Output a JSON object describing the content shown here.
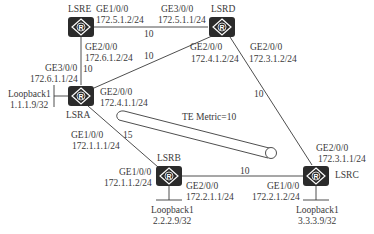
{
  "routers": [
    {
      "id": "LSRE",
      "label": "LSRE"
    },
    {
      "id": "LSRD",
      "label": "LSRD"
    },
    {
      "id": "LSRA",
      "label": "LSRA"
    },
    {
      "id": "LSRB",
      "label": "LSRB"
    },
    {
      "id": "LSRC",
      "label": "LSRC"
    }
  ],
  "router_icon_letter": "R",
  "interfaces": {
    "lsre_ge1": {
      "name": "GE1/0/0",
      "ip": "172.5.1.2/24"
    },
    "lsre_ge2": {
      "name": "GE2/0/0",
      "ip": "172.6.1.2/24"
    },
    "lsrd_ge3": {
      "name": "GE3/0/0",
      "ip": "172.5.1.1/24"
    },
    "lsrd_ge2_a": {
      "name": "GE2/0/0",
      "ip": "172.4.1.2/24"
    },
    "lsrd_ge2_c": {
      "name": "GE2/0/0",
      "ip": "172.3.1.2/24"
    },
    "lsra_ge3": {
      "name": "GE3/0/0",
      "ip": "172.6.1.1/24"
    },
    "lsra_ge2": {
      "name": "GE2/0/0",
      "ip": "172.4.1.1/24"
    },
    "lsra_ge1": {
      "name": "GE1/0/0",
      "ip": "172.1.1.1/24"
    },
    "lsrb_ge1": {
      "name": "GE1/0/0",
      "ip": "172.1.1.2/24"
    },
    "lsrb_ge2": {
      "name": "GE2/0/0",
      "ip": "172.2.1.1/24"
    },
    "lsrc_ge2": {
      "name": "GE2/0/0",
      "ip": "172.3.1.1/24"
    },
    "lsrc_ge1": {
      "name": "GE1/0/0",
      "ip": "172.2.1.2/24"
    }
  },
  "loopbacks": {
    "lsra": {
      "name": "Loopback1",
      "ip": "1.1.1.9/32"
    },
    "lsrb": {
      "name": "Loopback1",
      "ip": "2.2.2.9/32"
    },
    "lsrc": {
      "name": "Loopback1",
      "ip": "3.3.3.9/32"
    }
  },
  "link_costs": {
    "e_d": "10",
    "e_a": "10",
    "a_d": "10",
    "d_c": "10",
    "a_b": "15",
    "b_c": "10"
  },
  "tunnel": {
    "label": "TE Metric=10"
  },
  "colors": {
    "router_fill": "#2b2b2b",
    "line": "#3a3a3a",
    "text": "#3a3a3a"
  }
}
